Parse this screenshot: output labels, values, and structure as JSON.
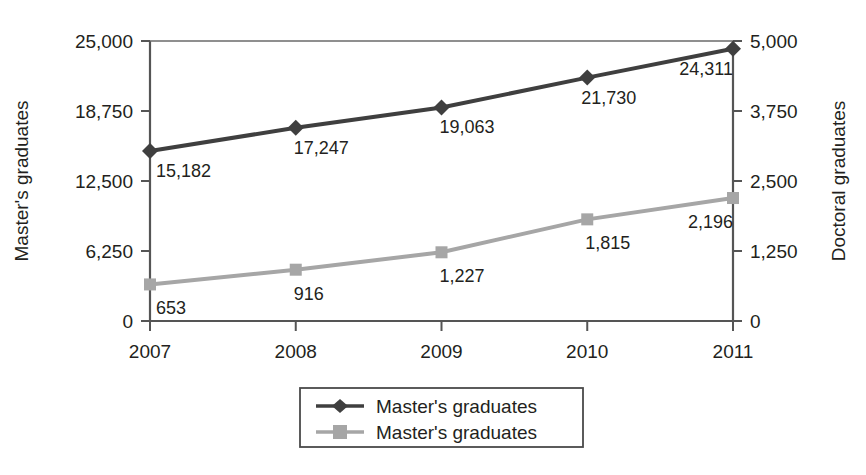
{
  "chart_data": {
    "type": "line",
    "title": "",
    "categories": [
      "2007",
      "2008",
      "2009",
      "2010",
      "2011"
    ],
    "x": [
      2007,
      2008,
      2009,
      2010,
      2011
    ],
    "grid": false,
    "legend_position": "bottom",
    "series": [
      {
        "name": "Master's graduates",
        "axis": "left",
        "color": "#3f3f3f",
        "marker": "diamond",
        "values": [
          15182,
          17247,
          19063,
          21730,
          24311
        ],
        "labels": [
          "15,182",
          "17,247",
          "19,063",
          "21,730",
          "24,311"
        ]
      },
      {
        "name": "Master's graduates",
        "axis": "right",
        "color": "#a6a6a6",
        "marker": "square",
        "values": [
          653,
          916,
          1227,
          1815,
          2196
        ],
        "labels": [
          "653",
          "916",
          "1,227",
          "1,815",
          "2,196"
        ]
      }
    ],
    "left_axis": {
      "label": "Master's graduates",
      "ticks": [
        0,
        6250,
        12500,
        18750,
        25000
      ],
      "tick_labels": [
        "0",
        "6,250",
        "12,500",
        "18,750",
        "25,000"
      ],
      "ylim": [
        0,
        25000
      ]
    },
    "right_axis": {
      "label": "Doctoral graduates",
      "ticks": [
        0,
        1250,
        2500,
        3750,
        5000
      ],
      "tick_labels": [
        "0",
        "1,250",
        "2,500",
        "3,750",
        "5,000"
      ],
      "ylim": [
        0,
        5000
      ]
    },
    "xlabel": "",
    "legend": [
      {
        "label": "Master's graduates",
        "color": "#3f3f3f",
        "marker": "diamond"
      },
      {
        "label": "Master's graduates",
        "color": "#a6a6a6",
        "marker": "square"
      }
    ]
  },
  "colors": {
    "series_dark": "#3f3f3f",
    "series_light": "#a6a6a6",
    "axis": "#555555",
    "text": "#231f20",
    "background": "#ffffff"
  }
}
